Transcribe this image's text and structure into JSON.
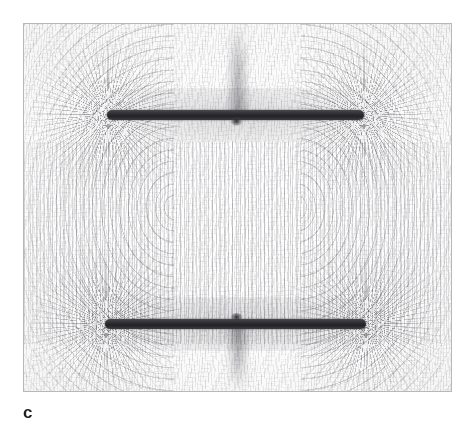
{
  "figure": {
    "caption_label": "c",
    "panel": {
      "kind": "photograph",
      "subject": "iron filings revealing the magnetic field of two parallel bar magnets in attraction",
      "alt_text": "Iron-filing pattern showing magnetic field lines around two horizontal bar magnets placed one above the other",
      "frame": {
        "x": 23,
        "y": 23,
        "width": 429,
        "height": 369
      },
      "border_color": "#b8b8b8",
      "background_color": "#fbfbfb"
    },
    "magnets": [
      {
        "name": "upper-bar-magnet",
        "orientation": "horizontal",
        "center_y": 114,
        "x_start": 107,
        "x_end": 363,
        "thickness": 10,
        "color": "#2f2f33",
        "nub_side": "below"
      },
      {
        "name": "lower-bar-magnet",
        "orientation": "horizontal",
        "center_y": 323,
        "x_start": 105,
        "x_end": 365,
        "thickness": 10,
        "color": "#2f2f33",
        "nub_side": "above"
      }
    ],
    "field_features": [
      {
        "name": "inter-magnet-vertical-lines",
        "region": "between the two magnets",
        "description": "filings align vertically spanning the gap"
      },
      {
        "name": "left-outer-loops",
        "region": "left of the magnets",
        "description": "broad arcs looping from upper to lower magnet"
      },
      {
        "name": "right-outer-loops",
        "region": "right of the magnets",
        "description": "mirror-image arcs looping from upper to lower magnet"
      },
      {
        "name": "pole-burst-upper-left",
        "x": 107,
        "y": 114
      },
      {
        "name": "pole-burst-upper-right",
        "x": 363,
        "y": 114
      },
      {
        "name": "pole-burst-lower-left",
        "x": 105,
        "y": 323
      },
      {
        "name": "pole-burst-lower-right",
        "x": 365,
        "y": 323
      },
      {
        "name": "neutral-streak-top",
        "region": "above upper magnet, centred"
      },
      {
        "name": "neutral-streak-bottom",
        "region": "below lower magnet, centred"
      }
    ]
  }
}
